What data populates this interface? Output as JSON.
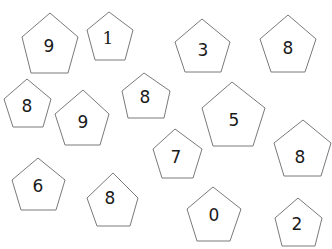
{
  "worksheet": {
    "stroke_color": "#7a7a7a",
    "text_color": "#1a1a1a",
    "pentagons": [
      {
        "label": "9",
        "points": "50,13 78,37 68,73 31,73 22,37",
        "tx": 49,
        "ty": 46
      },
      {
        "label": "1",
        "points": "109,12 133,30 125,60 95,60 87,30",
        "tx": 108,
        "ty": 38
      },
      {
        "label": "3",
        "points": "202,19 230,42 221,72 185,72 175,42",
        "tx": 203,
        "ty": 50
      },
      {
        "label": "8",
        "points": "288,15 316,39 305,72 271,72 260,39",
        "tx": 288,
        "ty": 48
      },
      {
        "label": "8",
        "points": "27,79 51,99 43,127 13,127 4,99",
        "tx": 27,
        "ty": 106
      },
      {
        "label": "9",
        "points": "83,90 109,114 100,145 65,145 55,114",
        "tx": 83,
        "ty": 122
      },
      {
        "label": "8",
        "points": "144,73 170,91 164,118 128,118 122,91",
        "tx": 145,
        "ty": 97
      },
      {
        "label": "5",
        "points": "232,82 265,108 253,146 213,146 202,108",
        "tx": 234,
        "ty": 120
      },
      {
        "label": "7",
        "points": "175,129 202,149 193,178 162,178 153,149",
        "tx": 176,
        "ty": 157
      },
      {
        "label": "8",
        "points": "303,120 331,143 321,176 284,176 274,143",
        "tx": 300,
        "ty": 157
      },
      {
        "label": "6",
        "points": "38,158 65,180 56,210 21,210 12,180",
        "tx": 38,
        "ty": 186
      },
      {
        "label": "8",
        "points": "113,173 138,198 130,226 97,226 87,198",
        "tx": 110,
        "ty": 198
      },
      {
        "label": "0",
        "points": "213,187 241,209 230,241 197,241 187,209",
        "tx": 214,
        "ty": 215
      },
      {
        "label": "2",
        "points": "298,198 322,218 315,246 282,246 275,218",
        "tx": 297,
        "ty": 224
      }
    ]
  }
}
